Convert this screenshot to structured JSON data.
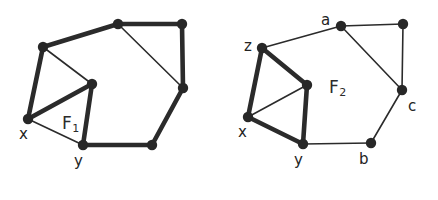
{
  "figure": {
    "background_color": "#ffffff",
    "edge_color": "#2b2b2b",
    "node_color": "#272727",
    "label_color": "#232323",
    "thin_edge_width": 1.6,
    "thick_edge_width": 4.6,
    "node_radius": 5.2,
    "width": 438,
    "height": 200
  },
  "graphs": [
    {
      "id": "left-graph",
      "face_label": {
        "base": "F",
        "sub": "1",
        "x": 62,
        "y": 115
      },
      "nodes": [
        {
          "id": "L_top",
          "x": 118,
          "y": 24,
          "label": "",
          "label_x": 0,
          "label_y": 0
        },
        {
          "id": "L_topright",
          "x": 182,
          "y": 24,
          "label": "",
          "label_x": 0,
          "label_y": 0
        },
        {
          "id": "L_z",
          "x": 43,
          "y": 47,
          "label": "",
          "label_x": 0,
          "label_y": 0
        },
        {
          "id": "L_mid",
          "x": 92,
          "y": 84,
          "label": "",
          "label_x": 0,
          "label_y": 0
        },
        {
          "id": "L_right",
          "x": 183,
          "y": 88,
          "label": "",
          "label_x": 0,
          "label_y": 0
        },
        {
          "id": "L_x",
          "x": 28,
          "y": 119,
          "label": "x",
          "label_x": 19,
          "label_y": 127
        },
        {
          "id": "L_y",
          "x": 83,
          "y": 145,
          "label": "y",
          "label_x": 74,
          "label_y": 154
        },
        {
          "id": "L_botright",
          "x": 152,
          "y": 145,
          "label": "",
          "label_x": 0,
          "label_y": 0
        }
      ],
      "edges": [
        {
          "from": "L_z",
          "to": "L_top",
          "weight": "thick"
        },
        {
          "from": "L_top",
          "to": "L_topright",
          "weight": "thick"
        },
        {
          "from": "L_topright",
          "to": "L_right",
          "weight": "thick"
        },
        {
          "from": "L_top",
          "to": "L_right",
          "weight": "thin"
        },
        {
          "from": "L_z",
          "to": "L_mid",
          "weight": "thin"
        },
        {
          "from": "L_z",
          "to": "L_x",
          "weight": "thick"
        },
        {
          "from": "L_x",
          "to": "L_mid",
          "weight": "thick"
        },
        {
          "from": "L_mid",
          "to": "L_y",
          "weight": "thick"
        },
        {
          "from": "L_x",
          "to": "L_y",
          "weight": "thin"
        },
        {
          "from": "L_y",
          "to": "L_botright",
          "weight": "thick"
        },
        {
          "from": "L_botright",
          "to": "L_right",
          "weight": "thick"
        }
      ]
    },
    {
      "id": "right-graph",
      "face_label": {
        "base": "F",
        "sub": "2",
        "x": 329,
        "y": 79
      },
      "nodes": [
        {
          "id": "R_a",
          "x": 341,
          "y": 26,
          "label": "a",
          "label_x": 321,
          "label_y": 13
        },
        {
          "id": "R_topright",
          "x": 403,
          "y": 24,
          "label": "",
          "label_x": 0,
          "label_y": 0
        },
        {
          "id": "R_z",
          "x": 262,
          "y": 48,
          "label": "z",
          "label_x": 244,
          "label_y": 39
        },
        {
          "id": "R_mid",
          "x": 307,
          "y": 85,
          "label": "",
          "label_x": 0,
          "label_y": 0
        },
        {
          "id": "R_c",
          "x": 402,
          "y": 90,
          "label": "c",
          "label_x": 408,
          "label_y": 99
        },
        {
          "id": "R_x",
          "x": 248,
          "y": 117,
          "label": "x",
          "label_x": 238,
          "label_y": 125
        },
        {
          "id": "R_y",
          "x": 303,
          "y": 144,
          "label": "y",
          "label_x": 294,
          "label_y": 153
        },
        {
          "id": "R_b",
          "x": 371,
          "y": 143,
          "label": "b",
          "label_x": 359,
          "label_y": 152
        }
      ],
      "edges": [
        {
          "from": "R_z",
          "to": "R_a",
          "weight": "thin"
        },
        {
          "from": "R_a",
          "to": "R_topright",
          "weight": "thin"
        },
        {
          "from": "R_topright",
          "to": "R_c",
          "weight": "thin"
        },
        {
          "from": "R_a",
          "to": "R_c",
          "weight": "thin"
        },
        {
          "from": "R_z",
          "to": "R_mid",
          "weight": "thick"
        },
        {
          "from": "R_z",
          "to": "R_x",
          "weight": "thick"
        },
        {
          "from": "R_x",
          "to": "R_mid",
          "weight": "thin"
        },
        {
          "from": "R_mid",
          "to": "R_y",
          "weight": "thick"
        },
        {
          "from": "R_x",
          "to": "R_y",
          "weight": "thick"
        },
        {
          "from": "R_y",
          "to": "R_b",
          "weight": "thin"
        },
        {
          "from": "R_b",
          "to": "R_c",
          "weight": "thin"
        }
      ]
    }
  ]
}
